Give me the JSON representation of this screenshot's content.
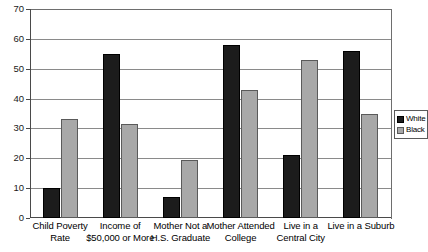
{
  "chart_data": {
    "type": "bar",
    "title": "",
    "subtitle": "",
    "xlabel": "",
    "ylabel": "",
    "ylim": [
      0,
      70
    ],
    "yticks": [
      0,
      10,
      20,
      30,
      40,
      50,
      60,
      70
    ],
    "ytick_labels": [
      "0",
      "10",
      "20",
      "30",
      "40",
      "50",
      "60",
      "70"
    ],
    "grid": true,
    "grid_axis": "y",
    "legend_position": "right",
    "categories": [
      "Child Poverty Rate",
      "Income of\n$50,000 or More",
      "Mother Not  a\nH.S. Graduate",
      "Mother Attended\nCollege",
      "Live in a\nCentral City",
      "Live in a Suburb"
    ],
    "series": [
      {
        "name": "White",
        "color": "#1c1c1c",
        "values": [
          10,
          55,
          7,
          58,
          21,
          56
        ]
      },
      {
        "name": "Black",
        "color": "#a8a8a8",
        "values": [
          33,
          31.5,
          19.5,
          43,
          53,
          35
        ]
      }
    ]
  },
  "legend": {
    "items": [
      {
        "label": "White",
        "swatch": "black-swatch"
      },
      {
        "label": "Black",
        "swatch": "gray-swatch"
      }
    ]
  }
}
